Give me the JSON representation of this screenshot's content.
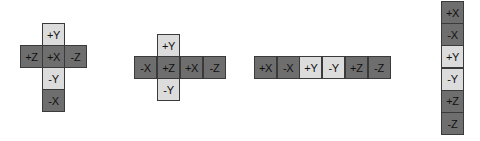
{
  "colors": {
    "dark_face": "#6e6e6e",
    "light_face": "#dcdcdc",
    "border": "#3a3a3a",
    "text": "#111111"
  },
  "nets": [
    {
      "name": "cross-net-x-center",
      "faces": [
        {
          "label": "+Y",
          "shade": "light",
          "col": 1,
          "row": 0
        },
        {
          "label": "+Z",
          "shade": "dark",
          "col": 0,
          "row": 1
        },
        {
          "label": "+X",
          "shade": "dark",
          "col": 1,
          "row": 1
        },
        {
          "label": "-Z",
          "shade": "dark",
          "col": 2,
          "row": 1
        },
        {
          "label": "-Y",
          "shade": "light",
          "col": 1,
          "row": 2
        },
        {
          "label": "-X",
          "shade": "dark",
          "col": 1,
          "row": 3
        }
      ]
    },
    {
      "name": "cross-net-horizontal",
      "faces": [
        {
          "label": "+Y",
          "shade": "light",
          "col": 1,
          "row": 0
        },
        {
          "label": "-X",
          "shade": "dark",
          "col": 0,
          "row": 1
        },
        {
          "label": "+Z",
          "shade": "dark",
          "col": 1,
          "row": 1
        },
        {
          "label": "+X",
          "shade": "dark",
          "col": 2,
          "row": 1
        },
        {
          "label": "-Z",
          "shade": "dark",
          "col": 3,
          "row": 1
        },
        {
          "label": "-Y",
          "shade": "light",
          "col": 1,
          "row": 2
        }
      ]
    },
    {
      "name": "horizontal-strip-net",
      "faces": [
        {
          "label": "+X",
          "shade": "dark",
          "col": 0,
          "row": 0
        },
        {
          "label": "-X",
          "shade": "dark",
          "col": 1,
          "row": 0
        },
        {
          "label": "+Y",
          "shade": "light",
          "col": 2,
          "row": 0
        },
        {
          "label": "-Y",
          "shade": "light",
          "col": 3,
          "row": 0
        },
        {
          "label": "+Z",
          "shade": "dark",
          "col": 4,
          "row": 0
        },
        {
          "label": "-Z",
          "shade": "dark",
          "col": 5,
          "row": 0
        }
      ]
    },
    {
      "name": "vertical-strip-net",
      "faces": [
        {
          "label": "+X",
          "shade": "dark",
          "col": 0,
          "row": 0
        },
        {
          "label": "-X",
          "shade": "dark",
          "col": 0,
          "row": 1
        },
        {
          "label": "+Y",
          "shade": "light",
          "col": 0,
          "row": 2
        },
        {
          "label": "-Y",
          "shade": "light",
          "col": 0,
          "row": 3
        },
        {
          "label": "+Z",
          "shade": "dark",
          "col": 0,
          "row": 4
        },
        {
          "label": "-Z",
          "shade": "dark",
          "col": 0,
          "row": 5
        }
      ]
    }
  ]
}
